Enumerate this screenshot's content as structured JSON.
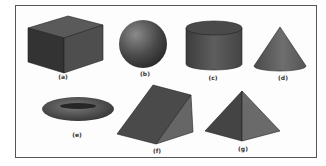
{
  "figure": {
    "shapes": [
      {
        "id": "a",
        "name": "cube",
        "label": "(a)"
      },
      {
        "id": "b",
        "name": "sphere",
        "label": "(b)"
      },
      {
        "id": "c",
        "name": "cylinder",
        "label": "(c)"
      },
      {
        "id": "d",
        "name": "cone",
        "label": "(d)"
      },
      {
        "id": "e",
        "name": "torus",
        "label": "(e)"
      },
      {
        "id": "f",
        "name": "triangular-prism",
        "label": "(f)"
      },
      {
        "id": "g",
        "name": "pyramid",
        "label": "(g)"
      }
    ]
  },
  "colors": {
    "frame": "#555555",
    "dark": "#3a3a3a",
    "mid": "#5a5a5a",
    "light": "#777777"
  }
}
